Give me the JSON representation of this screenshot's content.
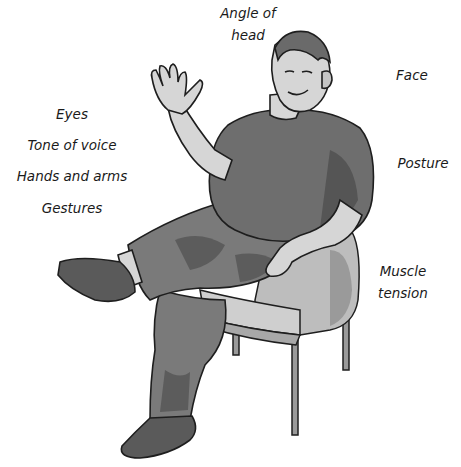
{
  "diagram": {
    "labels": [
      {
        "id": "angle-of-head",
        "lines": [
          "Angle of",
          "head"
        ]
      },
      {
        "id": "face",
        "lines": [
          "Face"
        ]
      },
      {
        "id": "eyes",
        "lines": [
          "Eyes"
        ]
      },
      {
        "id": "tone-of-voice",
        "lines": [
          "Tone of voice"
        ]
      },
      {
        "id": "hands-and-arms",
        "lines": [
          "Hands and arms"
        ]
      },
      {
        "id": "gestures",
        "lines": [
          "Gestures"
        ]
      },
      {
        "id": "posture",
        "lines": [
          "Posture"
        ]
      },
      {
        "id": "muscle-tension",
        "lines": [
          "Muscle",
          "tension"
        ]
      }
    ],
    "colors": {
      "background": "#ffffff",
      "text": "#1a1a1a",
      "shirt": "#6e6e6e",
      "shirt_shadow": "#555555",
      "pants": "#7a7a7a",
      "pants_shadow": "#5c5c5c",
      "skin": "#d6d6d6",
      "skin_shadow": "#b0b0b0",
      "hair": "#6a6a6a",
      "chair": "#bdbdbd",
      "chair_shadow": "#9a9a9a",
      "shoe": "#5a5a5a",
      "outline": "#1e1e1e"
    }
  }
}
